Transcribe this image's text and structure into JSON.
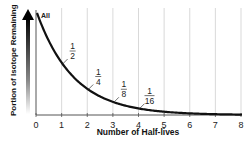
{
  "chart_data": {
    "type": "line",
    "title": "",
    "xlabel": "Number of Half-lives",
    "ylabel": "Portion of Isotope Remaining",
    "x": [
      0,
      1,
      2,
      3,
      4,
      5,
      6,
      7,
      8
    ],
    "series": [
      {
        "name": "Portion remaining",
        "values": [
          1,
          0.5,
          0.25,
          0.125,
          0.0625,
          0.03125,
          0.015625,
          0.0078125,
          0.00390625
        ]
      }
    ],
    "xlim": [
      0,
      8
    ],
    "ylim": [
      0,
      1
    ],
    "grid": {
      "vertical": true,
      "horizontal": false
    },
    "xticks": [
      "0",
      "1",
      "2",
      "3",
      "4",
      "5",
      "6",
      "7",
      "8"
    ],
    "annotations": [
      {
        "text": "All",
        "x": 0,
        "y": 1
      },
      {
        "num": "1",
        "den": "2",
        "x": 1,
        "y": 0.5
      },
      {
        "num": "1",
        "den": "4",
        "x": 2,
        "y": 0.25
      },
      {
        "num": "1",
        "den": "8",
        "x": 3,
        "y": 0.125
      },
      {
        "num": "1",
        "den": "16",
        "x": 4,
        "y": 0.0625
      }
    ],
    "legend": null
  },
  "colors": {
    "curve": "#111111",
    "grid": "#cfcfcf",
    "axis": "#555555"
  }
}
